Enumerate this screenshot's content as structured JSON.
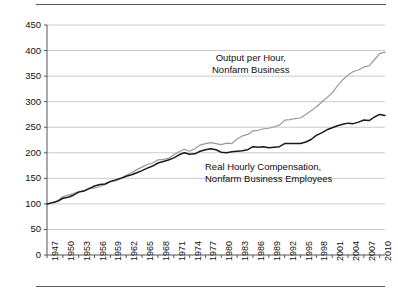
{
  "chart_data": {
    "type": "line",
    "title": "",
    "xlabel": "",
    "ylabel": "",
    "xlim": [
      1947,
      2011
    ],
    "ylim": [
      0,
      450
    ],
    "grid": true,
    "legend_position": "inline-annotations",
    "yticks": [
      0,
      50,
      100,
      150,
      200,
      250,
      300,
      350,
      400,
      450
    ],
    "xticks": [
      1947,
      1950,
      1953,
      1956,
      1959,
      1962,
      1965,
      1968,
      1971,
      1974,
      1977,
      1980,
      1983,
      1986,
      1989,
      1992,
      1995,
      1998,
      2001,
      2004,
      2007,
      2010
    ],
    "annotations": [
      {
        "id": "output",
        "lines": [
          "Output per Hour,",
          "Nonfarm Business"
        ]
      },
      {
        "id": "compensation",
        "lines": [
          "Real Hourly Compensation,",
          "Nonfarm Business Employees"
        ]
      }
    ],
    "series": [
      {
        "name": "Output per Hour, Nonfarm Business",
        "color": "#999999",
        "x": [
          1947,
          1948,
          1949,
          1950,
          1951,
          1952,
          1953,
          1954,
          1955,
          1956,
          1957,
          1958,
          1959,
          1960,
          1961,
          1962,
          1963,
          1964,
          1965,
          1966,
          1967,
          1968,
          1969,
          1970,
          1971,
          1972,
          1973,
          1974,
          1975,
          1976,
          1977,
          1978,
          1979,
          1980,
          1981,
          1982,
          1983,
          1984,
          1985,
          1986,
          1987,
          1988,
          1989,
          1990,
          1991,
          1992,
          1993,
          1994,
          1995,
          1996,
          1997,
          1998,
          1999,
          2000,
          2001,
          2002,
          2003,
          2004,
          2005,
          2006,
          2007,
          2008,
          2009,
          2010,
          2011
        ],
        "values": [
          100,
          103,
          106,
          114,
          117,
          120,
          124,
          126,
          131,
          131,
          134,
          138,
          143,
          145,
          150,
          156,
          161,
          167,
          172,
          177,
          180,
          186,
          187,
          189,
          196,
          202,
          207,
          203,
          208,
          215,
          218,
          220,
          218,
          216,
          219,
          218,
          227,
          233,
          236,
          243,
          244,
          247,
          248,
          251,
          254,
          264,
          265,
          267,
          268,
          275,
          282,
          290,
          299,
          308,
          317,
          331,
          343,
          352,
          359,
          362,
          368,
          370,
          382,
          394,
          397
        ]
      },
      {
        "name": "Real Hourly Compensation, Nonfarm Business Employees",
        "color": "#1a1a1a",
        "x": [
          1947,
          1948,
          1949,
          1950,
          1951,
          1952,
          1953,
          1954,
          1955,
          1956,
          1957,
          1958,
          1959,
          1960,
          1961,
          1962,
          1963,
          1964,
          1965,
          1966,
          1967,
          1968,
          1969,
          1970,
          1971,
          1972,
          1973,
          1974,
          1975,
          1976,
          1977,
          1978,
          1979,
          1980,
          1981,
          1982,
          1983,
          1984,
          1985,
          1986,
          1987,
          1988,
          1989,
          1990,
          1991,
          1992,
          1993,
          1994,
          1995,
          1996,
          1997,
          1998,
          1999,
          2000,
          2001,
          2002,
          2003,
          2004,
          2005,
          2006,
          2007,
          2008,
          2009,
          2010,
          2011
        ],
        "values": [
          100,
          102,
          105,
          111,
          113,
          117,
          123,
          125,
          130,
          135,
          138,
          139,
          144,
          147,
          150,
          154,
          157,
          161,
          165,
          170,
          174,
          180,
          183,
          186,
          190,
          196,
          200,
          197,
          198,
          203,
          206,
          208,
          206,
          201,
          200,
          202,
          203,
          204,
          206,
          212,
          211,
          212,
          210,
          211,
          212,
          218,
          218,
          218,
          218,
          221,
          226,
          234,
          239,
          245,
          249,
          253,
          256,
          258,
          257,
          260,
          264,
          263,
          270,
          275,
          273
        ]
      }
    ]
  }
}
